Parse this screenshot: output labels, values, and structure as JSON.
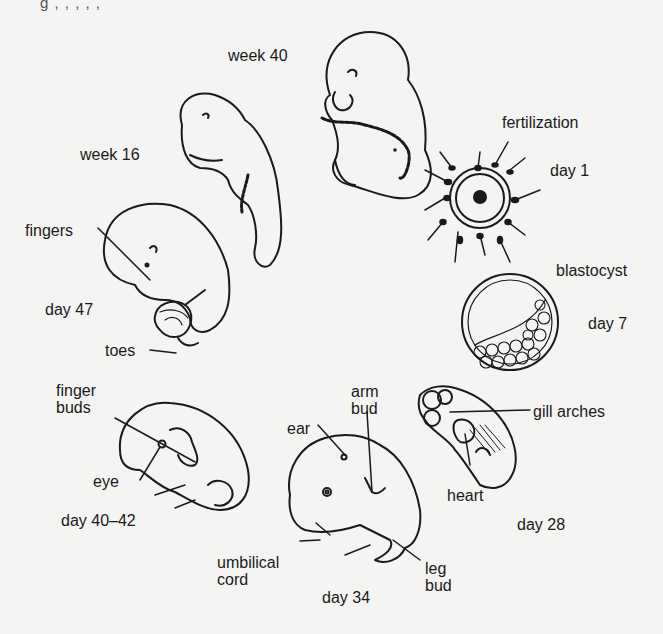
{
  "figure": {
    "top_cropped_text": "g  ,        ,          ,          ,           ,",
    "stages": [
      {
        "id": "week40",
        "label": "week 40"
      },
      {
        "id": "week16",
        "label": "week 16"
      },
      {
        "id": "fertilization",
        "label": "fertilization",
        "sublabel": "day 1"
      },
      {
        "id": "blastocyst",
        "label": "blastocyst",
        "sublabel": "day 7"
      },
      {
        "id": "day47",
        "label": "day 47"
      },
      {
        "id": "day40_42",
        "label": "day 40–42"
      },
      {
        "id": "day34",
        "label": "day 34"
      },
      {
        "id": "day28",
        "label": "day 28"
      }
    ],
    "annotations": {
      "fingers": "fingers",
      "toes": "toes",
      "finger_buds": "finger\nbuds",
      "eye": "eye",
      "ear": "ear",
      "arm_bud": "arm\nbud",
      "umbilical_cord": "umbilical\ncord",
      "leg_bud": "leg\nbud",
      "gill_arches": "gill arches",
      "heart": "heart"
    }
  },
  "colors": {
    "background": "#f4f4f2",
    "ink": "#1a1a1a"
  }
}
